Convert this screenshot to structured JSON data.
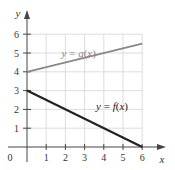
{
  "chart_data": {
    "type": "line",
    "title": "",
    "xlabel": "x",
    "ylabel": "y",
    "xlim": [
      0,
      6
    ],
    "ylim": [
      0,
      6
    ],
    "grid": true,
    "x_ticks": [
      "1",
      "2",
      "3",
      "4",
      "5",
      "6"
    ],
    "y_ticks": [
      "1",
      "2",
      "3",
      "4",
      "5",
      "6"
    ],
    "origin_label": "0",
    "series": [
      {
        "name": "y = f(x)",
        "x": [
          0,
          6
        ],
        "y": [
          3,
          0
        ],
        "color": "#222222",
        "label_pos": [
          3.6,
          2.2
        ]
      },
      {
        "name": "y = g(x)",
        "x": [
          0,
          6
        ],
        "y": [
          4,
          5.5
        ],
        "color": "#888888",
        "label_pos": [
          1.8,
          5.0
        ]
      }
    ],
    "legend": "inline labels"
  }
}
